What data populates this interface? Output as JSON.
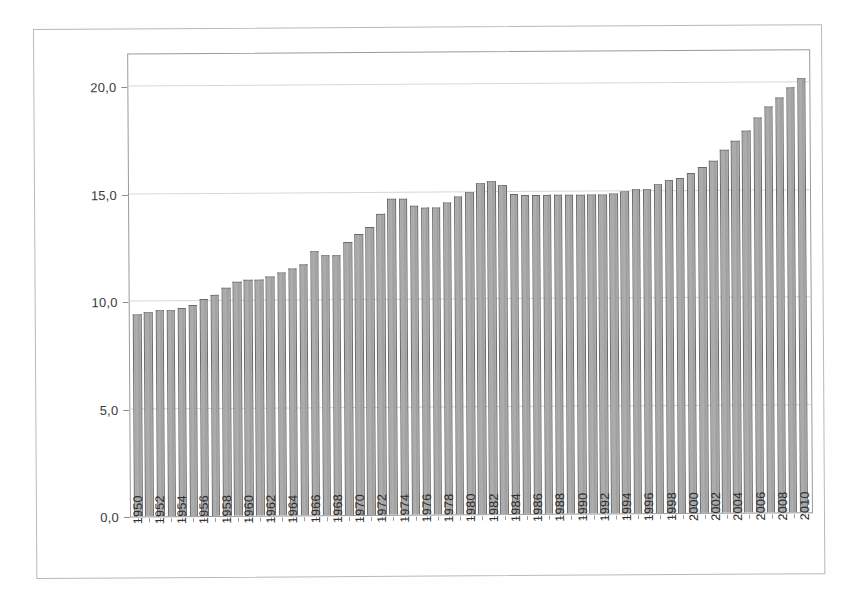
{
  "figure": {
    "caption_fragment": "",
    "background_color": "#ffffff",
    "frame_color": "#b9b9bd",
    "bar_fill_color": "#a8a8a8",
    "bar_border_color": "#6a6a6a",
    "gridline_color": "#d7d7da"
  },
  "chart_data": {
    "type": "bar",
    "title": "",
    "subtitle": "",
    "xlabel": "",
    "ylabel": "",
    "ylim": [
      0.0,
      21.5
    ],
    "ytick_labels": [
      "0,0",
      "5,0",
      "10,0",
      "15,0",
      "20,0"
    ],
    "ytick_values": [
      0.0,
      5.0,
      10.0,
      15.0,
      20.0
    ],
    "grid": true,
    "grid_axis": "y",
    "legend": false,
    "legend_position": "none",
    "decimal_separator": ",",
    "xtick_label_rotation": 90,
    "xtick_label_interval": 2,
    "categories": [
      "1950",
      "1951",
      "1952",
      "1953",
      "1954",
      "1955",
      "1956",
      "1957",
      "1958",
      "1959",
      "1960",
      "1961",
      "1962",
      "1963",
      "1964",
      "1965",
      "1966",
      "1967",
      "1968",
      "1969",
      "1970",
      "1971",
      "1972",
      "1973",
      "1974",
      "1975",
      "1976",
      "1977",
      "1978",
      "1979",
      "1980",
      "1981",
      "1982",
      "1983",
      "1984",
      "1985",
      "1986",
      "1987",
      "1988",
      "1989",
      "1990",
      "1991",
      "1992",
      "1993",
      "1994",
      "1995",
      "1996",
      "1997",
      "1998",
      "1999",
      "2000",
      "2001",
      "2002",
      "2003",
      "2004",
      "2005",
      "2006",
      "2007",
      "2008",
      "2009",
      "2010"
    ],
    "values": [
      9.4,
      9.5,
      9.6,
      9.6,
      9.7,
      9.8,
      10.1,
      10.3,
      10.6,
      10.9,
      11.0,
      11.0,
      11.1,
      11.3,
      11.5,
      11.7,
      12.3,
      12.1,
      12.1,
      12.7,
      13.1,
      13.4,
      14.0,
      14.7,
      14.7,
      14.4,
      14.3,
      14.3,
      14.5,
      14.8,
      15.0,
      15.4,
      15.5,
      15.3,
      14.9,
      14.85,
      14.85,
      14.85,
      14.85,
      14.85,
      14.85,
      14.85,
      14.85,
      14.9,
      15.0,
      15.1,
      15.1,
      15.3,
      15.5,
      15.6,
      15.8,
      16.1,
      16.4,
      16.9,
      17.3,
      17.8,
      18.4,
      18.9,
      19.3,
      19.8,
      20.2
    ]
  }
}
